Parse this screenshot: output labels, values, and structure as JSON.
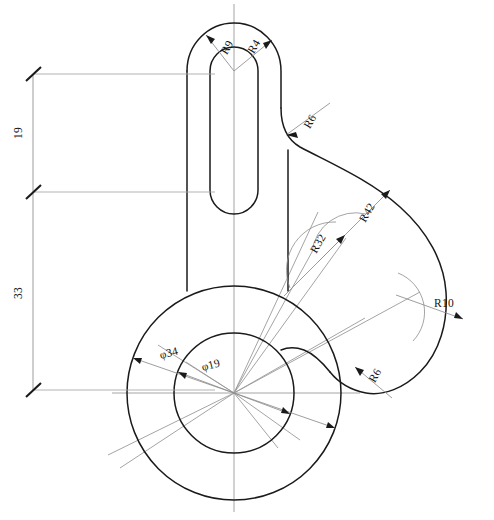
{
  "drawing": {
    "title": "Mechanical Part Orthographic View",
    "type": "engineering-drawing",
    "background_color": "#ffffff",
    "line_color": "#1a1a1a",
    "construction_color": "#9a9a9a",
    "canvas": {
      "width": 494,
      "height": 520
    }
  },
  "dimensions": {
    "radii": [
      {
        "id": "r9",
        "label": "R9",
        "value": 9,
        "x": 228,
        "y": 47,
        "rotation": -62
      },
      {
        "id": "r4",
        "label": "R4",
        "value": 4,
        "x": 255,
        "y": 47,
        "rotation": -62
      },
      {
        "id": "r6_top",
        "label": "R6",
        "value": 6,
        "x": 309,
        "y": 122,
        "rotation": -62
      },
      {
        "id": "r42",
        "label": "R42",
        "value": 42,
        "x": 368,
        "y": 212,
        "rotation": -62
      },
      {
        "id": "r32",
        "label": "R32",
        "value": 32,
        "x": 319,
        "y": 243,
        "rotation": -62
      },
      {
        "id": "r10",
        "label": "R10",
        "value": 10,
        "x": 444,
        "y": 305,
        "rotation": 0
      },
      {
        "id": "r6_bottom",
        "label": "R6",
        "value": 6,
        "x": 375,
        "y": 375,
        "rotation": -62
      }
    ],
    "diameters": [
      {
        "id": "d34",
        "label": "φ34",
        "value": 34,
        "x": 168,
        "y": 354,
        "rotation": -14
      },
      {
        "id": "d19",
        "label": "φ19",
        "value": 19,
        "x": 209,
        "y": 365,
        "rotation": -14
      }
    ],
    "linear": [
      {
        "id": "dim19",
        "label": "19",
        "value": 19,
        "x": 19,
        "y": 133,
        "rotation": -90
      },
      {
        "id": "dim33",
        "label": "33",
        "value": 33,
        "x": 19,
        "y": 293,
        "rotation": -90
      }
    ]
  },
  "geometry": {
    "hub": {
      "cx": 234,
      "cy": 393,
      "outer_r": 107,
      "inner_r": 60
    },
    "arm": {
      "left_x": 187,
      "right_x": 288,
      "top_cy": 71,
      "outer_r": 48,
      "slot_r": 25,
      "slot_bottom_cy": 190
    },
    "dimension_stack_x": 33,
    "tick_y": [
      74,
      192,
      390
    ]
  }
}
